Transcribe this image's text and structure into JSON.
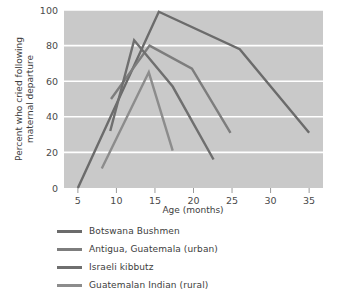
{
  "chart_data": {
    "type": "line",
    "title": "",
    "xlabel": "Age (months)",
    "ylabel": "Percent who cried following maternal departure",
    "xlim": [
      3.2,
      36.8
    ],
    "ylim": [
      0,
      100
    ],
    "xticks": [
      5,
      10,
      15,
      20,
      25,
      30,
      35
    ],
    "yticks": [
      0,
      20,
      40,
      60,
      80,
      100
    ],
    "grid": "horizontal",
    "plot_background": "#c9c9c9",
    "gridline_color": "#ffffff",
    "legend_position": "below-axes",
    "series": [
      {
        "name": "Botswana Bushmen",
        "color": "#6b6b6b",
        "x": [
          5,
          15.5,
          26,
          35
        ],
        "y": [
          0,
          99,
          78,
          31
        ]
      },
      {
        "name": "Antigua, Guatemala (urban)",
        "color": "#7d7d7d",
        "x": [
          9.3,
          14.3,
          19.8,
          24.8
        ],
        "y": [
          50,
          80,
          67,
          31
        ]
      },
      {
        "name": "Israeli kibbutz",
        "color": "#6f6f6f",
        "x": [
          9.2,
          12.3,
          17.3,
          22.6
        ],
        "y": [
          32,
          83,
          57,
          16
        ]
      },
      {
        "name": "Guatemalan Indian (rural)",
        "color": "#8c8c8c",
        "x": [
          8.1,
          14.2,
          17.3
        ],
        "y": [
          11,
          65,
          21
        ]
      }
    ]
  },
  "axes": {
    "y_title_line1": "Percent who cried following",
    "y_title_line2": "maternal departure",
    "x_title": "Age (months)",
    "ytick_labels": [
      "0",
      "20",
      "40",
      "60",
      "80",
      "100"
    ],
    "xtick_labels": [
      "5",
      "10",
      "15",
      "20",
      "25",
      "30",
      "35"
    ]
  },
  "legend": {
    "items": [
      {
        "label": "Botswana Bushmen",
        "color": "#6b6b6b"
      },
      {
        "label": "Antigua, Guatemala (urban)",
        "color": "#7d7d7d"
      },
      {
        "label": "Israeli kibbutz",
        "color": "#6f6f6f"
      },
      {
        "label": "Guatemalan Indian (rural)",
        "color": "#8c8c8c"
      }
    ]
  }
}
